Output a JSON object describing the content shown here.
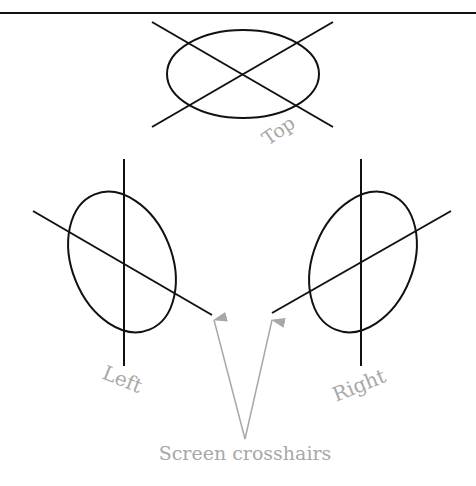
{
  "figure": {
    "labels": {
      "top": "Top",
      "left": "Left",
      "right": "Right",
      "caption": "Screen crosshairs"
    },
    "colors": {
      "stroke": "#111111",
      "label": "#a8a8a8",
      "arrow": "#a8a8a8"
    }
  }
}
